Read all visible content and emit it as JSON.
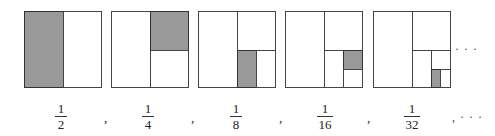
{
  "figure": {
    "shade_color": "#999999",
    "line_color": "#444444",
    "squares": [
      {
        "index": 1,
        "shaded_fraction": "1/2"
      },
      {
        "index": 2,
        "shaded_fraction": "1/4"
      },
      {
        "index": 3,
        "shaded_fraction": "1/8"
      },
      {
        "index": 4,
        "shaded_fraction": "1/16"
      },
      {
        "index": 5,
        "shaded_fraction": "1/32"
      }
    ],
    "continuation_after_squares": "· · ·",
    "fractions": [
      {
        "num": "1",
        "den": "2"
      },
      {
        "num": "1",
        "den": "4"
      },
      {
        "num": "1",
        "den": "8"
      },
      {
        "num": "1",
        "den": "16"
      },
      {
        "num": "1",
        "den": "32"
      }
    ],
    "separator": ",",
    "continuation_after_fractions": ", · · ·"
  }
}
